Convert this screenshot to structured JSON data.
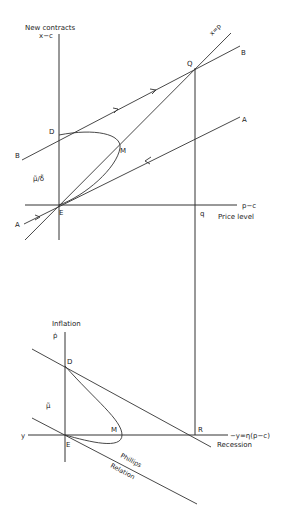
{
  "top_panel": {
    "y_axis_label": "New contracts",
    "y_axis_var": "x−c",
    "x_axis_var": "p−c",
    "x_axis_label": "Price level",
    "ratio_label": "μ̃/δ̃",
    "diagonal_label": "x=p",
    "points": {
      "D": "D",
      "M": "M",
      "E": "E",
      "Q": "Q",
      "q": "q"
    },
    "lines": {
      "B_left": "B",
      "B_right": "B",
      "A_left": "A",
      "A_right": "A"
    }
  },
  "bottom_panel": {
    "y_axis_label": "Inflation",
    "y_axis_var": "ṗ",
    "x_axis_var": "−y=η(p−c)",
    "x_axis_label": "Recession",
    "left_axis_label": "y",
    "mu_label": "μ̃",
    "curve_label_1": "Phillips",
    "curve_label_2": "Relation",
    "points": {
      "D": "D",
      "M": "M",
      "E": "E",
      "R": "R"
    }
  }
}
